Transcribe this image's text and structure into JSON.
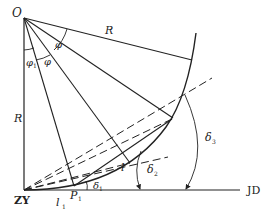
{
  "diagram": {
    "title": "",
    "labels": {
      "origin": "O",
      "radius_top": "R",
      "radius_left": "R",
      "angle_phi_a": "φ",
      "angle_phi_b": "φ",
      "angle_phi1": "φ",
      "angle_phi1_sub": "1",
      "chord_l": "l",
      "chord_l1": "l",
      "chord_l1_sub": "1",
      "point_p1": "P",
      "point_p1_sub": "1",
      "delta1": "δ",
      "delta1_sub": "1",
      "delta2": "δ",
      "delta2_sub": "2",
      "delta3": "δ",
      "delta3_sub": "3",
      "start_point": "ZY",
      "tangent_point": "JD"
    },
    "colors": {
      "stroke": "#222222",
      "background": "#ffffff"
    }
  }
}
